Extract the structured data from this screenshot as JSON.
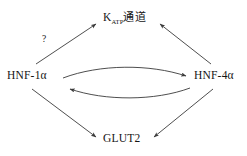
{
  "diagram": {
    "background_color": "#ffffff",
    "stroke_color": "#3a3a3a",
    "text_color": "#141414",
    "nodes": [
      {
        "id": "katp",
        "label_prefix": "K",
        "label_subscript": "ATP",
        "label_suffix": "通道",
        "full_label": "Kₐₜₚ通道"
      },
      {
        "id": "hnf1a",
        "full_label": "HNF-1α"
      },
      {
        "id": "hnf4a",
        "full_label": "HNF-4α"
      },
      {
        "id": "glut2",
        "full_label": "GLUT2"
      }
    ],
    "annotations": [
      {
        "id": "uncertain-link",
        "text": "?"
      }
    ],
    "edges": [
      {
        "id": "hnf1a-to-katp",
        "from": "hnf1a",
        "to": "katp",
        "style": "straight",
        "arrowheads": "end",
        "annotation": "?"
      },
      {
        "id": "hnf4a-to-katp",
        "from": "hnf4a",
        "to": "katp",
        "style": "straight",
        "arrowheads": "end"
      },
      {
        "id": "hnf1a-to-hnf4a",
        "from": "hnf1a",
        "to": "hnf4a",
        "style": "curved-upper",
        "arrowheads": "end"
      },
      {
        "id": "hnf4a-to-hnf1a",
        "from": "hnf4a",
        "to": "hnf1a",
        "style": "curved-lower",
        "arrowheads": "end"
      },
      {
        "id": "hnf1a-to-glut2",
        "from": "hnf1a",
        "to": "glut2",
        "style": "straight",
        "arrowheads": "end"
      },
      {
        "id": "hnf4a-to-glut2",
        "from": "hnf4a",
        "to": "glut2",
        "style": "straight",
        "arrowheads": "end"
      }
    ]
  }
}
